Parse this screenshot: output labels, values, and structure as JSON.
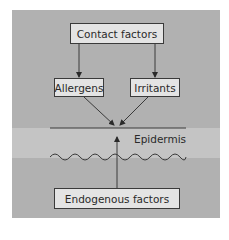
{
  "diagram": {
    "nodes": {
      "contact_factors": "Contact factors",
      "allergens": "Allergens",
      "irritants": "Irritants",
      "endogenous_factors": "Endogenous factors"
    },
    "layer_label": "Epidermis",
    "edges": [
      {
        "from": "Contact factors",
        "to": "Allergens"
      },
      {
        "from": "Contact factors",
        "to": "Irritants"
      },
      {
        "from": "Allergens",
        "to": "Epidermis"
      },
      {
        "from": "Irritants",
        "to": "Epidermis"
      },
      {
        "from": "Endogenous factors",
        "to": "Epidermis"
      }
    ],
    "colors": {
      "panel": "#b1b1b1",
      "epidermis_band": "#c4c4c4",
      "box_fill": "#e4e4e4",
      "stroke": "#3a3a3a"
    }
  }
}
